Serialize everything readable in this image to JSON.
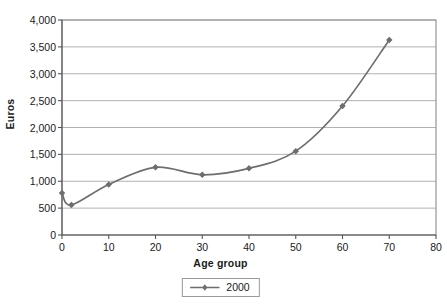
{
  "chart_data": {
    "type": "line",
    "title": "",
    "subtitle": "",
    "xlabel": "Age group",
    "ylabel": "Euros",
    "xlim": [
      0,
      80
    ],
    "ylim": [
      0,
      4000
    ],
    "grid": "horizontal",
    "legend_position": "bottom",
    "x_ticks": [
      0,
      10,
      20,
      30,
      40,
      50,
      60,
      70,
      80
    ],
    "x_tick_labels": [
      "0",
      "10",
      "20",
      "30",
      "40",
      "50",
      "60",
      "70",
      "80"
    ],
    "y_ticks": [
      0,
      500,
      1000,
      1500,
      2000,
      2500,
      3000,
      3500,
      4000
    ],
    "y_tick_labels": [
      "0",
      "500",
      "1,000",
      "1,500",
      "2,000",
      "2,500",
      "3,000",
      "3,500",
      "4,000"
    ],
    "series": [
      {
        "name": "2000",
        "color": "#6e6e6e",
        "marker": "diamond",
        "x": [
          0,
          2,
          10,
          20,
          30,
          40,
          50,
          60,
          70
        ],
        "values": [
          780,
          560,
          940,
          1260,
          1120,
          1240,
          1560,
          2400,
          3630
        ]
      }
    ]
  },
  "legend": {
    "items": [
      {
        "label": "2000",
        "color": "#6e6e6e"
      }
    ]
  },
  "colors": {
    "series": "#6e6e6e",
    "gridline": "#9e9e9e",
    "axis": "#555555",
    "frame": "#808080",
    "background": "#ffffff",
    "text": "#1a1a1a"
  }
}
